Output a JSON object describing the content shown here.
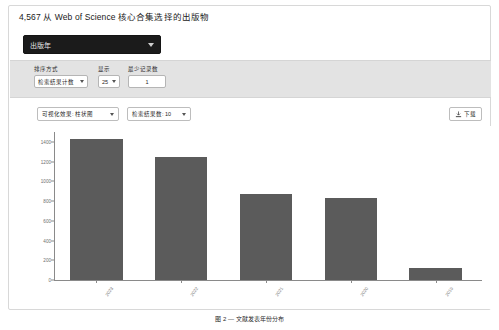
{
  "page": {
    "title": "4,567 从 Web of Science 核心合集选择的出版物",
    "caption": "图 2 — 文献发表年份分布"
  },
  "field_select": {
    "label": "出版年",
    "caret_icon": "chevron-down-icon"
  },
  "controls": [
    {
      "id": "sort",
      "label": "排序方式",
      "value": "检索结果计数",
      "type": "select",
      "caret_icon": "chevron-down-icon"
    },
    {
      "id": "show",
      "label": "显示",
      "value": "25",
      "type": "select",
      "caret_icon": "chevron-down-icon"
    },
    {
      "id": "min_records",
      "label": "最少记录数",
      "value": "1",
      "type": "input"
    }
  ],
  "chart_toolbar": {
    "viz_select": {
      "value": "可视化效果: 柱状图",
      "caret_icon": "chevron-down-icon"
    },
    "rows_select": {
      "value": "检索结果数: 10",
      "caret_icon": "chevron-down-icon"
    },
    "download_button": {
      "label": "下载",
      "icon": "download-icon"
    }
  },
  "chart_data": {
    "type": "bar",
    "title": "",
    "xlabel": "",
    "ylabel": "",
    "categories": [
      "2023",
      "2022",
      "2021",
      "2020",
      "2019"
    ],
    "values": [
      1430,
      1250,
      870,
      830,
      120
    ],
    "ylim": [
      0,
      1500
    ],
    "yticks": [
      0,
      200,
      400,
      600,
      800,
      1000,
      1200,
      1400
    ],
    "ytick_labels": [
      "0",
      "200",
      "400",
      "600",
      "800",
      "1000",
      "1200",
      "1400"
    ],
    "grid": false,
    "legend": false,
    "bar_color": "#5b5b5b"
  },
  "colors": {
    "panel_border": "#d8d8d8",
    "dark_select_bg": "#1b1b1b",
    "controls_strip_bg": "#e3e3e3",
    "bar": "#5b5b5b",
    "axis": "#8a8a8a"
  }
}
